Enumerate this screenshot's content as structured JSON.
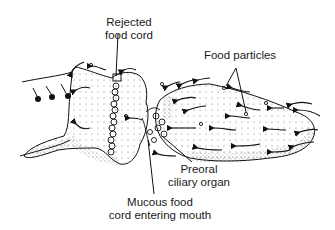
{
  "figure": {
    "labels": {
      "rejected_food_cord_line1": "Rejected",
      "rejected_food_cord_line2": "food cord",
      "food_particles": "Food particles",
      "preoral_line1": "Preoral",
      "preoral_line2": "ciliary organ",
      "mucous_line1": "Mucous food",
      "mucous_line2": "cord entering mouth"
    },
    "colors": {
      "ink": "#1a1a1a",
      "background": "#ffffff",
      "stipple": "#444444"
    }
  }
}
